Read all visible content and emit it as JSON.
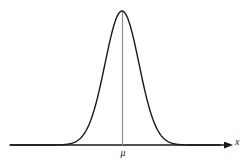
{
  "figure": {
    "background_color": "#ffffff",
    "width": 250,
    "height": 166
  },
  "labels": {
    "mean_symbol": "μ",
    "x_axis": "x"
  },
  "style": {
    "curve_color": "#1a1a1a",
    "axis_color": "#1a1a1a",
    "mean_line_color": "#8c8c8c",
    "curve_width": 1.4,
    "axis_width": 1.4,
    "mean_line_width": 1.2
  },
  "chart_data": {
    "type": "line",
    "title": "",
    "subtitle": "",
    "xlabel": "x",
    "ylabel": "",
    "grid": false,
    "legend": null,
    "annotations": [
      {
        "name": "mean-tick-label",
        "text": "μ",
        "x": 0,
        "y": 0,
        "placement": "below-axis-at-mean"
      },
      {
        "name": "x-axis-arrow-label",
        "text": "x",
        "placement": "right-end-of-axis"
      }
    ],
    "axis": {
      "x_start_px": 10,
      "x_end_px": 232,
      "y_baseline_px": 145,
      "arrowhead": true,
      "y_axis_drawn": false,
      "ticks": []
    },
    "distribution": {
      "name": "normal",
      "mean_label": "μ",
      "mean_px": 122,
      "sigma_px": 17,
      "peak_px_y": 11,
      "baseline_px_y": 145,
      "amplitude_px": 134
    },
    "mean_line": {
      "from": [
        122,
        11
      ],
      "to": [
        122,
        145
      ],
      "drawn": true
    },
    "x": [
      -3.5,
      -3.25,
      -3.0,
      -2.75,
      -2.5,
      -2.25,
      -2.0,
      -1.75,
      -1.5,
      -1.25,
      -1.0,
      -0.75,
      -0.5,
      -0.25,
      0.0,
      0.25,
      0.5,
      0.75,
      1.0,
      1.25,
      1.5,
      1.75,
      2.0,
      2.25,
      2.5,
      2.75,
      3.0,
      3.25,
      3.5
    ],
    "values": [
      0.0022,
      0.0051,
      0.0111,
      0.0228,
      0.0439,
      0.0796,
      0.1353,
      0.2163,
      0.3247,
      0.4578,
      0.6065,
      0.7548,
      0.8825,
      0.9692,
      1.0,
      0.9692,
      0.8825,
      0.7548,
      0.6065,
      0.4578,
      0.3247,
      0.2163,
      0.1353,
      0.0796,
      0.0439,
      0.0228,
      0.0111,
      0.0051,
      0.0022
    ],
    "xlim": [
      -3.5,
      3.5
    ],
    "ylim": [
      0,
      1.05
    ]
  }
}
